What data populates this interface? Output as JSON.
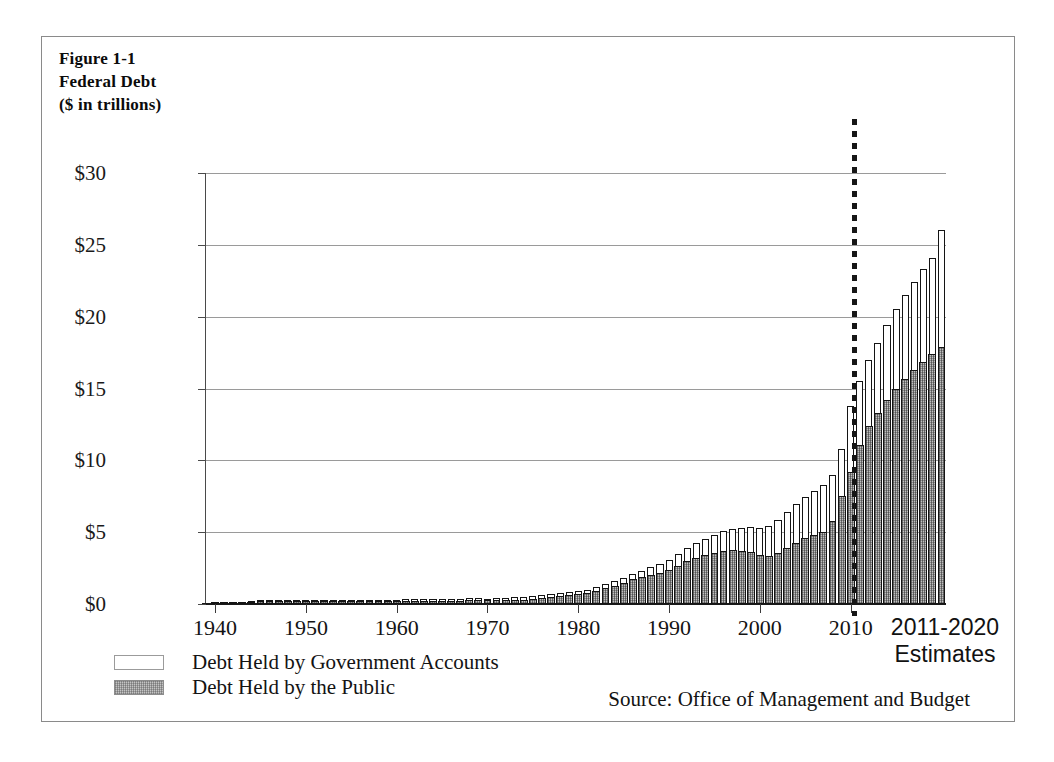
{
  "figure": {
    "label": "Figure 1-1",
    "title": "Federal Debt",
    "units": "($ in trillions)"
  },
  "legend": {
    "items": [
      {
        "label": "Debt Held by Government Accounts",
        "swatch": "white",
        "color": "#ffffff"
      },
      {
        "label": "Debt Held by the Public",
        "swatch": "hatched-gray",
        "color": "#c4c4c4"
      }
    ]
  },
  "source_note": "Source: Office of Management and Budget",
  "projection_label": {
    "line1": "2011-2020",
    "line2": "Estimates"
  },
  "axes": {
    "y_tick_labels": [
      "$30",
      "$25",
      "$20",
      "$15",
      "$10",
      "$5",
      "$0"
    ],
    "x_tick_labels": [
      "1940",
      "1950",
      "1960",
      "1970",
      "1980",
      "1990",
      "2000",
      "2010"
    ]
  },
  "chart_data": {
    "type": "bar",
    "title": "Federal Debt",
    "subtitle": "($ in trillions)",
    "xlabel": "",
    "ylabel": "$ in trillions",
    "ylim": [
      0,
      30
    ],
    "yticks": [
      0,
      5,
      10,
      15,
      20,
      25,
      30
    ],
    "xticks": [
      1940,
      1950,
      1960,
      1970,
      1980,
      1990,
      2000,
      2010
    ],
    "xlim": [
      1939,
      2020.5
    ],
    "grid": "horizontal",
    "stacked": true,
    "legend_position": "below-left",
    "annotations": [
      {
        "text": "2011-2020 Estimates",
        "x": 2015.5,
        "note": "projection region right of dotted divider at 2010.5"
      },
      {
        "text": "Source: Office of Management and Budget",
        "position": "bottom-right"
      }
    ],
    "x": [
      1940,
      1941,
      1942,
      1943,
      1944,
      1945,
      1946,
      1947,
      1948,
      1949,
      1950,
      1951,
      1952,
      1953,
      1954,
      1955,
      1956,
      1957,
      1958,
      1959,
      1960,
      1961,
      1962,
      1963,
      1964,
      1965,
      1966,
      1967,
      1968,
      1969,
      1970,
      1971,
      1972,
      1973,
      1974,
      1975,
      1976,
      1977,
      1978,
      1979,
      1980,
      1981,
      1982,
      1983,
      1984,
      1985,
      1986,
      1987,
      1988,
      1989,
      1990,
      1991,
      1992,
      1993,
      1994,
      1995,
      1996,
      1997,
      1998,
      1999,
      2000,
      2001,
      2002,
      2003,
      2004,
      2005,
      2006,
      2007,
      2008,
      2009,
      2010,
      2011,
      2012,
      2013,
      2014,
      2015,
      2016,
      2017,
      2018,
      2019,
      2020
    ],
    "series": [
      {
        "name": "Debt Held by the Public",
        "values": [
          0.04,
          0.06,
          0.08,
          0.14,
          0.18,
          0.24,
          0.24,
          0.22,
          0.22,
          0.22,
          0.22,
          0.21,
          0.21,
          0.22,
          0.22,
          0.23,
          0.22,
          0.22,
          0.23,
          0.24,
          0.24,
          0.25,
          0.25,
          0.26,
          0.26,
          0.26,
          0.26,
          0.27,
          0.29,
          0.28,
          0.28,
          0.3,
          0.32,
          0.34,
          0.34,
          0.39,
          0.48,
          0.55,
          0.61,
          0.64,
          0.71,
          0.79,
          0.93,
          1.14,
          1.31,
          1.5,
          1.74,
          1.89,
          2.05,
          2.19,
          2.41,
          2.69,
          3.0,
          3.25,
          3.43,
          3.6,
          3.73,
          3.77,
          3.72,
          3.63,
          3.41,
          3.34,
          3.55,
          3.92,
          4.3,
          4.59,
          4.83,
          5.04,
          5.8,
          7.55,
          9.2,
          11.1,
          12.4,
          13.3,
          14.2,
          15.0,
          15.7,
          16.3,
          16.9,
          17.4,
          17.9
        ],
        "fill": "hatched-gray"
      },
      {
        "name": "Debt Held by Government Accounts",
        "values": [
          0.01,
          0.01,
          0.02,
          0.02,
          0.02,
          0.03,
          0.03,
          0.04,
          0.05,
          0.05,
          0.05,
          0.06,
          0.06,
          0.06,
          0.06,
          0.06,
          0.06,
          0.06,
          0.06,
          0.06,
          0.07,
          0.07,
          0.07,
          0.08,
          0.08,
          0.08,
          0.09,
          0.1,
          0.1,
          0.11,
          0.1,
          0.11,
          0.11,
          0.12,
          0.14,
          0.15,
          0.15,
          0.16,
          0.17,
          0.19,
          0.2,
          0.21,
          0.22,
          0.24,
          0.27,
          0.32,
          0.37,
          0.44,
          0.51,
          0.59,
          0.68,
          0.8,
          0.91,
          1.0,
          1.1,
          1.21,
          1.32,
          1.45,
          1.6,
          1.76,
          1.9,
          2.1,
          2.27,
          2.45,
          2.64,
          2.83,
          3.04,
          3.24,
          3.21,
          3.27,
          4.6,
          4.4,
          4.6,
          4.9,
          5.2,
          5.5,
          5.8,
          6.1,
          6.4,
          6.7,
          8.1
        ],
        "fill": "white"
      }
    ],
    "totals": [
      0.05,
      0.07,
      0.1,
      0.16,
      0.2,
      0.27,
      0.27,
      0.26,
      0.27,
      0.27,
      0.27,
      0.27,
      0.27,
      0.28,
      0.28,
      0.29,
      0.28,
      0.28,
      0.29,
      0.3,
      0.31,
      0.32,
      0.32,
      0.34,
      0.34,
      0.34,
      0.35,
      0.37,
      0.39,
      0.39,
      0.38,
      0.41,
      0.43,
      0.46,
      0.48,
      0.54,
      0.63,
      0.71,
      0.78,
      0.83,
      0.91,
      1.0,
      1.15,
      1.38,
      1.58,
      1.82,
      2.11,
      2.33,
      2.56,
      2.78,
      3.09,
      3.49,
      3.91,
      4.25,
      4.53,
      4.81,
      5.05,
      5.22,
      5.32,
      5.39,
      5.31,
      5.44,
      5.82,
      6.37,
      6.94,
      7.42,
      7.87,
      8.28,
      9.01,
      10.82,
      13.8,
      15.5,
      17.0,
      18.2,
      19.4,
      20.5,
      21.5,
      22.4,
      23.3,
      24.1,
      26.0
    ]
  }
}
